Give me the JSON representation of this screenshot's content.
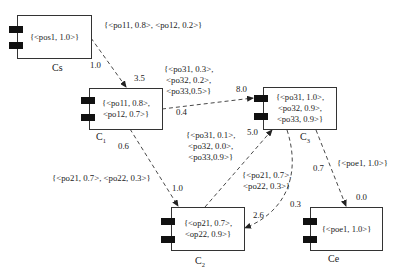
{
  "components": {
    "cs": {
      "name": "Cs",
      "sub": "",
      "content": [
        "{<pos1, 1.0>}"
      ]
    },
    "c1": {
      "name": "C",
      "sub": "1",
      "content": [
        "{<po11, 0.8>,",
        "<po12, 0.7>}"
      ]
    },
    "c2": {
      "name": "C",
      "sub": "2",
      "content": [
        "{<op21, 0.7>,",
        "<op22, 0.9>}"
      ]
    },
    "c3": {
      "name": "C",
      "sub": "3",
      "content": [
        "{<po31, 1.0>,",
        "<po32, 0.9>,",
        "<po33, 0.9>}"
      ]
    },
    "ce": {
      "name": "Ce",
      "sub": "",
      "content": [
        "{<poe1, 1.0>}"
      ]
    }
  },
  "edges": {
    "cs_c1": {
      "from_weight": "1.0",
      "to_weight": "3.5",
      "annotation": [
        "{<po11, 0.8>, <po12, 0.2>}"
      ]
    },
    "c1_c3": {
      "from_weight": "0.4",
      "to_weight": "8.0",
      "annotation": [
        "{<po31, 0.3>,",
        "<po32, 0.2>,",
        "<po33,0.5>}"
      ]
    },
    "c1_c2": {
      "from_weight": "0.6",
      "to_weight": "1.0",
      "annotation": [
        "{<po21, 0.7>, <po22, 0.3>}"
      ]
    },
    "c2_c3": {
      "from_weight": "",
      "to_weight": "5.0",
      "annotation": [
        "{<po31, 0.1>,",
        "<po32, 0.0>,",
        "<po33,0.9>}"
      ]
    },
    "c3_c2": {
      "from_weight": "0.3",
      "to_weight": "2.6",
      "annotation": [
        "{<po21, 0.7>,",
        "<po22, 0.3>}"
      ]
    },
    "c3_ce": {
      "from_weight": "0.7",
      "to_weight": "0.0",
      "annotation": [
        "{<poe1, 1.0>}"
      ]
    }
  },
  "colors": {
    "line": "#333333",
    "port": "#111111",
    "background": "#ffffff"
  }
}
